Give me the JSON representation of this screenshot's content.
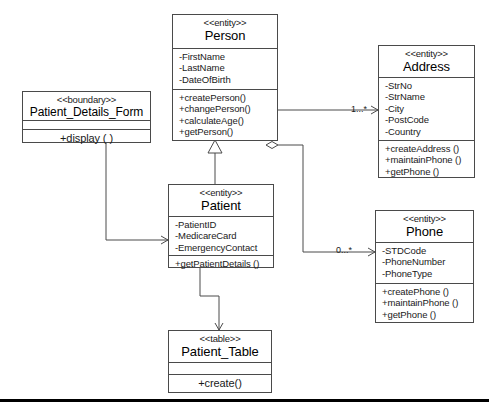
{
  "diagram": {
    "type": "uml-class-diagram",
    "background": "#ffffff",
    "line_color": "#4a4a4a",
    "classes": [
      {
        "id": "person",
        "stereotype": "<<entity>>",
        "name": "Person",
        "attributes": [
          "-FirstName",
          "-LastName",
          "-DateOfBirth"
        ],
        "operations": [
          "+createPerson()",
          "+changePerson()",
          "+calculateAge()",
          "+getPerson()"
        ]
      },
      {
        "id": "address",
        "stereotype": "<<entity>>",
        "name": "Address",
        "attributes": [
          "-StrNo",
          "-StrName",
          "-City",
          "-PostCode",
          "-Country"
        ],
        "operations": [
          "+createAddress ()",
          "+maintainPhone ()",
          "+getPhone ()"
        ]
      },
      {
        "id": "patient_details_form",
        "stereotype": "<<boundary>>",
        "name": "Patient_Details_Form",
        "attributes": [],
        "operations": [
          "+display ( )"
        ]
      },
      {
        "id": "patient",
        "stereotype": "<<entity>>",
        "name": "Patient",
        "attributes": [
          "-PatientID",
          "-MedicareCard",
          "-EmergencyContact"
        ],
        "operations": [
          "+getPatientDetails ()"
        ]
      },
      {
        "id": "phone",
        "stereotype": "<<entity>>",
        "name": "Phone",
        "attributes": [
          "-STDCode",
          "-PhoneNumber",
          "-PhoneType"
        ],
        "operations": [
          "+createPhone ()",
          "+maintainPhone ()",
          "+getPhone ()"
        ]
      },
      {
        "id": "patient_table",
        "stereotype": "<<table>>",
        "name": "Patient_Table",
        "attributes": [],
        "operations": [
          "+create()"
        ]
      }
    ],
    "multiplicities": [
      {
        "id": "address-mult",
        "label": "1...*"
      },
      {
        "id": "phone-mult",
        "label": "0...*"
      }
    ],
    "relationships": [
      {
        "id": "person-address",
        "kind": "aggregation",
        "from": "person",
        "to": "address"
      },
      {
        "id": "person-phone",
        "kind": "aggregation",
        "from": "person",
        "to": "phone"
      },
      {
        "id": "patient-person",
        "kind": "generalization",
        "from": "patient",
        "to": "person"
      },
      {
        "id": "form-patient",
        "kind": "association-directed",
        "from": "patient_details_form",
        "to": "patient"
      },
      {
        "id": "patient-table",
        "kind": "association-directed",
        "from": "patient",
        "to": "patient_table"
      }
    ]
  }
}
